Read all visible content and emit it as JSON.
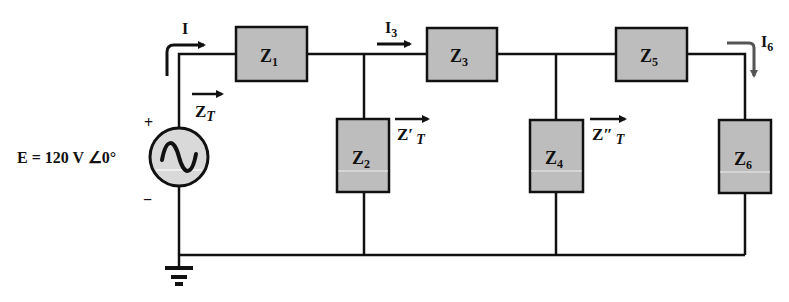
{
  "source": {
    "label": "E = 120 V ∠0°",
    "plus": "+",
    "minus": "−"
  },
  "currents": {
    "I": "I",
    "I3": {
      "main": "I",
      "sub": "3"
    },
    "I6": {
      "main": "I",
      "sub": "6"
    }
  },
  "impedance_labels": {
    "ZT": {
      "main": "Z",
      "sub": "T"
    },
    "ZpT": {
      "main": "Z′",
      "sub": "T"
    },
    "ZppT": {
      "main": "Z″",
      "sub": "T"
    }
  },
  "impedances": [
    {
      "main": "Z",
      "sub": "1"
    },
    {
      "main": "Z",
      "sub": "2"
    },
    {
      "main": "Z",
      "sub": "3"
    },
    {
      "main": "Z",
      "sub": "4"
    },
    {
      "main": "Z",
      "sub": "5"
    },
    {
      "main": "Z",
      "sub": "6"
    }
  ],
  "colors": {
    "wire": "#111111",
    "box_fill": "#bdbdbd",
    "source_fill": "#d9d9d9",
    "i6_arrow": "#555555"
  }
}
